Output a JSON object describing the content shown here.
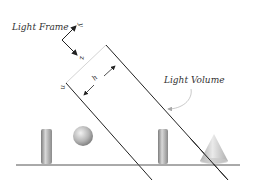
{
  "diagram": {
    "labels": {
      "light_frame": "Light Frame",
      "light_volume": "Light Volume",
      "axis_y": "y",
      "axis_z": "z",
      "dim_h": "h",
      "normal_n": "n"
    },
    "objects": [
      "cylinder",
      "sphere",
      "cylinder",
      "cone"
    ],
    "colors": {
      "line": "#222222",
      "faint_line": "#cccccc",
      "ground": "#444444",
      "object_light": "#e0e0e0",
      "object_dark": "#8a8a8a"
    }
  }
}
